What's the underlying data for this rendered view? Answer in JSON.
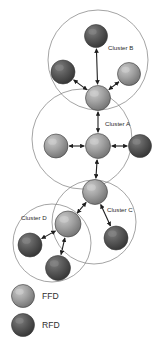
{
  "figure": {
    "type": "network-cluster-diagram",
    "background_color": "#ffffff",
    "width": 161,
    "height": 352
  },
  "palette": {
    "ffd_fill": "#9a9a9a",
    "ffd_highlight": "#c2c2c2",
    "ffd_shadow": "#6f6f6f",
    "rfd_fill": "#565656",
    "rfd_highlight": "#7e7e7e",
    "rfd_shadow": "#333333",
    "node_outline": "#3a3a3a",
    "cluster_outline": "#7d7d7d",
    "arrow_color": "#1e1e1e",
    "text_color": "#2b2b2b"
  },
  "clusters": [
    {
      "id": "cluster-b",
      "label": "Cluster B",
      "cx": 98,
      "cy": 60,
      "r": 50,
      "label_x": 108,
      "label_y": 50
    },
    {
      "id": "cluster-a",
      "label": "Cluster A",
      "cx": 82,
      "cy": 139,
      "r": 50,
      "label_x": 105,
      "label_y": 126
    },
    {
      "id": "cluster-c",
      "label": "Cluster C",
      "cx": 94,
      "cy": 222,
      "r": 42,
      "label_x": 107,
      "label_y": 212
    },
    {
      "id": "cluster-d",
      "label": "Cluster D",
      "cx": 52,
      "cy": 243,
      "r": 39,
      "label_x": 21,
      "label_y": 220
    }
  ],
  "nodes": [
    {
      "id": "b-top",
      "cluster": "cluster-b",
      "type": "RFD",
      "cx": 96,
      "cy": 36,
      "r": 11.5
    },
    {
      "id": "b-left",
      "cluster": "cluster-b",
      "type": "RFD",
      "cx": 63,
      "cy": 72,
      "r": 12.0
    },
    {
      "id": "b-right",
      "cluster": "cluster-b",
      "type": "FFD",
      "cx": 129,
      "cy": 74,
      "r": 11.5
    },
    {
      "id": "b-hub",
      "cluster": "cluster-b",
      "type": "FFD",
      "cx": 98,
      "cy": 98,
      "r": 12.5
    },
    {
      "id": "a-left",
      "cluster": "cluster-a",
      "type": "FFD",
      "cx": 56,
      "cy": 146,
      "r": 12.0
    },
    {
      "id": "a-hub",
      "cluster": "cluster-a",
      "type": "FFD",
      "cx": 98,
      "cy": 146,
      "r": 12.5
    },
    {
      "id": "a-right",
      "cluster": "cluster-a",
      "type": "RFD",
      "cx": 140,
      "cy": 146,
      "r": 11.5
    },
    {
      "id": "c-hub",
      "cluster": "cluster-c",
      "type": "FFD",
      "cx": 95,
      "cy": 192,
      "r": 12.5
    },
    {
      "id": "c-right",
      "cluster": "cluster-c",
      "type": "RFD",
      "cx": 116,
      "cy": 238,
      "r": 12.0
    },
    {
      "id": "d-hub",
      "cluster": "cluster-d",
      "type": "FFD",
      "cx": 68,
      "cy": 224,
      "r": 13.0
    },
    {
      "id": "d-left",
      "cluster": "cluster-d",
      "type": "RFD",
      "cx": 30,
      "cy": 245,
      "r": 12.0
    },
    {
      "id": "d-bottom",
      "cluster": "cluster-d",
      "type": "RFD",
      "cx": 58,
      "cy": 268,
      "r": 12.5
    }
  ],
  "edges": [
    {
      "from": "b-hub",
      "to": "b-left",
      "arrow": "both"
    },
    {
      "from": "b-hub",
      "to": "b-right",
      "arrow": "both"
    },
    {
      "from": "b-hub",
      "to": "b-top",
      "arrow": "both"
    },
    {
      "from": "a-hub",
      "to": "a-left",
      "arrow": "both"
    },
    {
      "from": "a-hub",
      "to": "a-right",
      "arrow": "both"
    },
    {
      "from": "a-hub",
      "to": "b-hub",
      "arrow": "both"
    },
    {
      "from": "a-hub",
      "to": "c-hub",
      "arrow": "both"
    },
    {
      "from": "c-hub",
      "to": "c-right",
      "arrow": "both"
    },
    {
      "from": "c-hub",
      "to": "d-hub",
      "arrow": "both"
    },
    {
      "from": "d-hub",
      "to": "d-left",
      "arrow": "both"
    },
    {
      "from": "d-hub",
      "to": "d-bottom",
      "arrow": "both"
    }
  ],
  "legend": {
    "items": [
      {
        "id": "legend-ffd",
        "label": "FFD",
        "type": "FFD",
        "cx": 23,
        "cy": 296,
        "r": 11.5,
        "label_x": 42,
        "label_y": 299
      },
      {
        "id": "legend-rfd",
        "label": "RFD",
        "type": "RFD",
        "cx": 23,
        "cy": 325,
        "r": 11.5,
        "label_x": 42,
        "label_y": 328
      }
    ]
  }
}
